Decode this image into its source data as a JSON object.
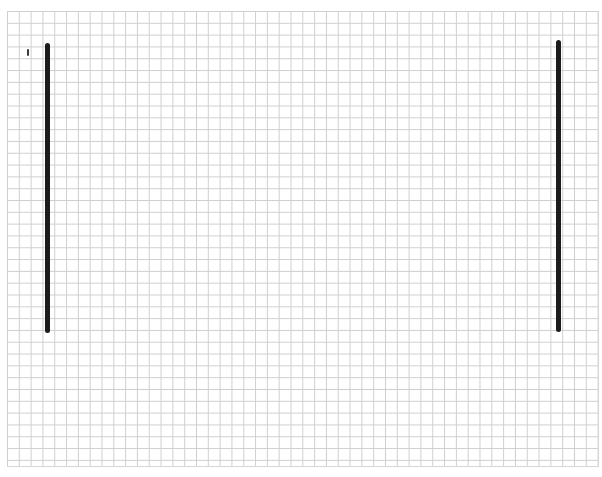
{
  "canvas": {
    "background": "#ffffff",
    "grid": {
      "color": "#cfcfcf",
      "cell_size_px": 11.8,
      "columns": 50,
      "rows": 38
    }
  },
  "shapes": {
    "left_bar": {
      "color": "#1c1c1c",
      "x": 45,
      "y": 43,
      "width": 5,
      "height": 290
    },
    "right_bar": {
      "color": "#1c1c1c",
      "x": 556,
      "y": 40,
      "width": 5,
      "height": 292
    },
    "small_mark": {
      "color": "#3a3a3a",
      "x": 27,
      "y": 49,
      "width": 2,
      "height": 7
    }
  }
}
